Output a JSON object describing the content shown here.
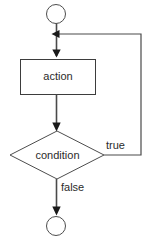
{
  "diagram": {
    "type": "flowchart",
    "background_color": "#ffffff",
    "line_color": "#4a4a4a",
    "text_color": "#2b2b2b",
    "nodes": [
      {
        "id": "start",
        "shape": "circle",
        "label": "",
        "cx": 56,
        "cy": 14,
        "r": 9.5
      },
      {
        "id": "action",
        "shape": "rectangle",
        "label": "action",
        "x": 20,
        "y": 59,
        "width": 75,
        "height": 36
      },
      {
        "id": "condition",
        "shape": "diamond",
        "label": "condition",
        "cx": 57,
        "cy": 155,
        "half_width": 47,
        "half_height": 24
      },
      {
        "id": "end",
        "shape": "circle",
        "label": "",
        "cx": 56,
        "cy": 226,
        "r": 9.5
      }
    ],
    "edges": [
      {
        "id": "start-to-action",
        "from": "start",
        "to": "action",
        "label": "",
        "arrow": true
      },
      {
        "id": "action-to-condition",
        "from": "action",
        "to": "condition",
        "label": "",
        "arrow": true
      },
      {
        "id": "condition-true-loop",
        "from": "condition",
        "to": "action",
        "label": "true",
        "label_x": 106,
        "label_y": 146,
        "arrow": true
      },
      {
        "id": "condition-false-exit",
        "from": "condition",
        "to": "end",
        "label": "false",
        "label_x": 61,
        "label_y": 188,
        "arrow": true
      }
    ]
  }
}
